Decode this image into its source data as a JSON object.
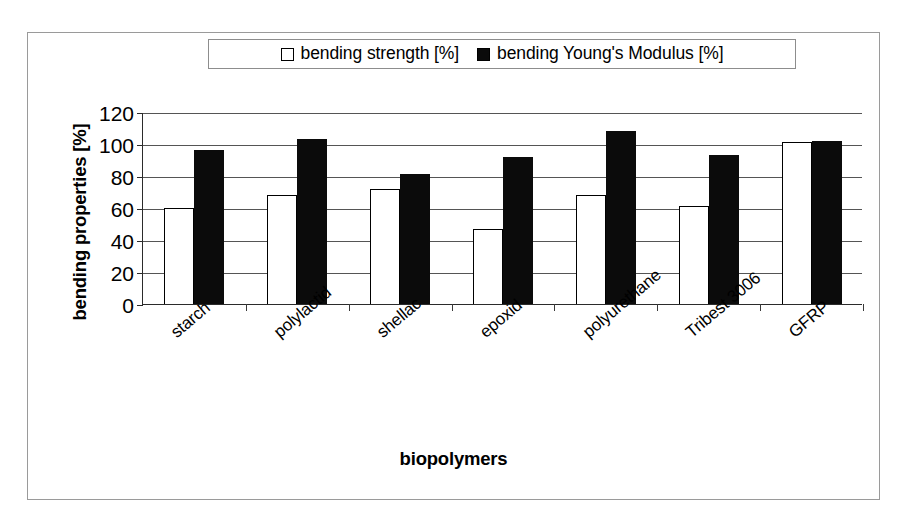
{
  "chart_data": {
    "type": "bar",
    "title": "",
    "xlabel": "biopolymers",
    "ylabel": "bending properties [%]",
    "categories": [
      "starch",
      "polylactid",
      "shellac",
      "epoxid",
      "polyurethane",
      "Tribest 3006",
      "GFRP"
    ],
    "series": [
      {
        "name": "bending strength [%]",
        "color": "#ffffff",
        "edge_color": "#000000",
        "values": [
          60,
          68,
          72,
          47,
          68,
          61,
          101
        ]
      },
      {
        "name": "bending Young's Modulus [%]",
        "color": "#0b0b0b",
        "edge_color": "#0b0b0b",
        "values": [
          96,
          103,
          81,
          92,
          108,
          93,
          102
        ]
      }
    ],
    "ylim": [
      0,
      120
    ],
    "yticks": [
      0,
      20,
      40,
      60,
      80,
      100,
      120
    ],
    "ytick_labels": [
      "0",
      "20",
      "40",
      "60",
      "80",
      "100",
      "120"
    ],
    "grid": true,
    "legend_position": "top-center",
    "legend_entries": [
      "bending strength [%]",
      "bending Young's Modulus [%]"
    ]
  }
}
